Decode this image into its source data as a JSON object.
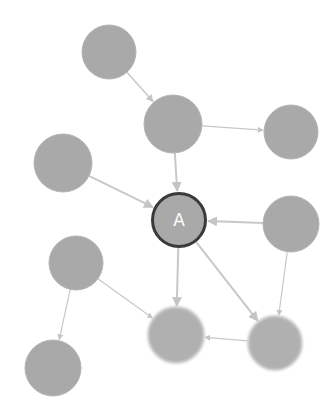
{
  "diagram": {
    "type": "directed-graph",
    "colors": {
      "background": "#ffffff",
      "node_fill": "#a9a9a9",
      "node_soft_fill": "#b0b0b0",
      "highlight_stroke": "#3a3a3a",
      "edge": "#c8c8c8",
      "label": "#ffffff"
    },
    "nodes": [
      {
        "id": "n1",
        "label": "",
        "x": 109,
        "y": 52,
        "r": 27,
        "style": "normal"
      },
      {
        "id": "n2",
        "label": "",
        "x": 173,
        "y": 124,
        "r": 29,
        "style": "normal"
      },
      {
        "id": "n3",
        "label": "",
        "x": 291,
        "y": 132,
        "r": 27,
        "style": "normal"
      },
      {
        "id": "n4",
        "label": "",
        "x": 63,
        "y": 163,
        "r": 29,
        "style": "normal"
      },
      {
        "id": "A",
        "label": "A",
        "x": 179,
        "y": 220,
        "r": 28,
        "style": "highlighted"
      },
      {
        "id": "n5",
        "label": "",
        "x": 291,
        "y": 224,
        "r": 28,
        "style": "normal"
      },
      {
        "id": "n6",
        "label": "",
        "x": 76,
        "y": 263,
        "r": 27,
        "style": "normal"
      },
      {
        "id": "n7",
        "label": "",
        "x": 176,
        "y": 335,
        "r": 28,
        "style": "soft"
      },
      {
        "id": "n8",
        "label": "",
        "x": 275,
        "y": 343,
        "r": 27,
        "style": "soft"
      },
      {
        "id": "n9",
        "label": "",
        "x": 53,
        "y": 368,
        "r": 28,
        "style": "normal"
      }
    ],
    "edges": [
      {
        "from": "n1",
        "to": "n2",
        "weight": 1.5
      },
      {
        "from": "n2",
        "to": "n3",
        "weight": 1.2
      },
      {
        "from": "n2",
        "to": "A",
        "weight": 2
      },
      {
        "from": "n4",
        "to": "A",
        "weight": 2
      },
      {
        "from": "n5",
        "to": "A",
        "weight": 2
      },
      {
        "from": "A",
        "to": "n7",
        "weight": 2
      },
      {
        "from": "A",
        "to": "n8",
        "weight": 2
      },
      {
        "from": "n5",
        "to": "n8",
        "weight": 1.2
      },
      {
        "from": "n8",
        "to": "n7",
        "weight": 1.2
      },
      {
        "from": "n6",
        "to": "n7",
        "weight": 1.2
      },
      {
        "from": "n6",
        "to": "n9",
        "weight": 1.2
      }
    ]
  }
}
